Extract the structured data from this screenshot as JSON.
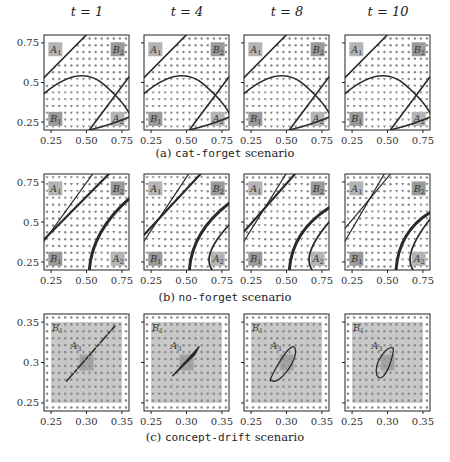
{
  "figure": {
    "column_titles": [
      "t = 1",
      "t = 4",
      "t = 8",
      "t = 10"
    ],
    "captions": [
      {
        "prefix": "(a) ",
        "mono": "cat-forget",
        "suffix": " scenario"
      },
      {
        "prefix": "(b) ",
        "mono": "no-forget",
        "suffix": " scenario"
      },
      {
        "prefix": "(c) ",
        "mono": "concept-drift",
        "suffix": " scenario"
      }
    ],
    "colors": {
      "axis": "#222222",
      "curve": "#2a2a2a",
      "marker": "#8c8c8c",
      "label_box": "#b4b4b4",
      "label_box_dark": "#9a9a9a",
      "shaded_region": "#c8c8c8",
      "background": "#ffffff"
    }
  },
  "chart_data": [
    {
      "type": "scatter",
      "row": "a",
      "title": "(a) cat-forget scenario",
      "panels": [
        "t = 1",
        "t = 4",
        "t = 8",
        "t = 10"
      ],
      "xlim": [
        0.2,
        0.8
      ],
      "ylim": [
        0.2,
        0.8
      ],
      "xticks": [
        0.25,
        0.5,
        0.75
      ],
      "xtick_labels": [
        "0.25",
        "0.50",
        "0.75"
      ],
      "yticks": [
        0.25,
        0.5,
        0.75
      ],
      "ytick_labels": [
        "0.25",
        "0.5",
        "0.75"
      ],
      "region_labels": [
        {
          "text": "A1",
          "x": 0.28,
          "y": 0.71
        },
        {
          "text": "B2",
          "x": 0.72,
          "y": 0.71
        },
        {
          "text": "B1",
          "x": 0.28,
          "y": 0.27
        },
        {
          "text": "A2",
          "x": 0.72,
          "y": 0.27
        }
      ],
      "marker_legend": [
        "dots: class-1 prediction",
        "triangles: class-2 prediction"
      ],
      "grid_on": false,
      "legend_position": "none"
    },
    {
      "type": "scatter",
      "row": "b",
      "title": "(b) no-forget scenario",
      "panels": [
        "t = 1",
        "t = 4",
        "t = 8",
        "t = 10"
      ],
      "xlim": [
        0.2,
        0.8
      ],
      "ylim": [
        0.2,
        0.8
      ],
      "xticks": [
        0.25,
        0.5,
        0.75
      ],
      "xtick_labels": [
        "0.25",
        "0.50",
        "0.75"
      ],
      "yticks": [
        0.25,
        0.5,
        0.75
      ],
      "ytick_labels": [
        "0.25",
        "0.5",
        "0.75"
      ],
      "region_labels": [
        {
          "text": "A1",
          "x": 0.28,
          "y": 0.71
        },
        {
          "text": "B2",
          "x": 0.72,
          "y": 0.71
        },
        {
          "text": "B1",
          "x": 0.28,
          "y": 0.27
        },
        {
          "text": "A2",
          "x": 0.72,
          "y": 0.27
        }
      ],
      "grid_on": false,
      "legend_position": "none"
    },
    {
      "type": "scatter",
      "row": "c",
      "title": "(c) concept-drift scenario",
      "panels": [
        "t = 1",
        "t = 4",
        "t = 8",
        "t = 10"
      ],
      "xlim": [
        0.24,
        0.36
      ],
      "ylim": [
        0.24,
        0.36
      ],
      "xticks": [
        0.25,
        0.3,
        0.35
      ],
      "xtick_labels": [
        "0.25",
        "0.30",
        "0.35"
      ],
      "yticks": [
        0.25,
        0.3,
        0.35
      ],
      "ytick_labels": [
        "0.25",
        "0.3",
        "0.35"
      ],
      "region_labels": [
        {
          "text": "B1",
          "x": 0.257,
          "y": 0.343
        },
        {
          "text": "A3",
          "x": 0.283,
          "y": 0.321
        }
      ],
      "shaded_square": [
        0.25,
        0.25,
        0.35,
        0.35
      ],
      "a3_box": [
        0.29,
        0.29,
        0.31,
        0.31
      ],
      "grid_on": false,
      "legend_position": "none"
    }
  ]
}
